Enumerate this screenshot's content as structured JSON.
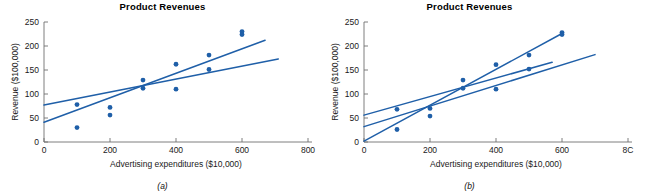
{
  "figure": {
    "panels": [
      {
        "id": "a",
        "caption": "(a)",
        "chart_data": {
          "type": "scatter",
          "title": "Product Revenues",
          "xlabel": "Advertising expenditures ($10,000)",
          "ylabel": "Revenue ($100,000)",
          "xlim": [
            0,
            800
          ],
          "ylim": [
            0,
            250
          ],
          "xticks": [
            0,
            200,
            400,
            600,
            800
          ],
          "yticks": [
            0,
            50,
            100,
            150,
            200,
            250
          ],
          "grid": false,
          "legend": "none",
          "points": [
            {
              "x": 100,
              "y": 78
            },
            {
              "x": 100,
              "y": 30
            },
            {
              "x": 200,
              "y": 72
            },
            {
              "x": 200,
              "y": 56
            },
            {
              "x": 300,
              "y": 129
            },
            {
              "x": 300,
              "y": 112
            },
            {
              "x": 400,
              "y": 162
            },
            {
              "x": 400,
              "y": 110
            },
            {
              "x": 500,
              "y": 181
            },
            {
              "x": 500,
              "y": 151
            },
            {
              "x": 600,
              "y": 230
            },
            {
              "x": 600,
              "y": 224
            }
          ],
          "lines": [
            {
              "name": "steeper-fit",
              "x0": 0,
              "y0": 41,
              "x1": 670,
              "y1": 212
            },
            {
              "name": "flatter-fit",
              "x0": 0,
              "y0": 77,
              "x1": 710,
              "y1": 173
            }
          ]
        }
      },
      {
        "id": "b",
        "caption": "(b)",
        "chart_data": {
          "type": "scatter",
          "title": "Product Revenues",
          "xlabel": "Advertising expenditures ($10,000)",
          "ylabel": "Revenue ($100,000)",
          "xlim": [
            0,
            800
          ],
          "ylim": [
            0,
            250
          ],
          "xticks": [
            0,
            200,
            400,
            600,
            800
          ],
          "yticks": [
            0,
            50,
            100,
            150,
            200,
            250
          ],
          "xtick_last_clipped": "8C",
          "grid": false,
          "legend": "none",
          "points": [
            {
              "x": 100,
              "y": 68
            },
            {
              "x": 100,
              "y": 26
            },
            {
              "x": 200,
              "y": 70
            },
            {
              "x": 200,
              "y": 54
            },
            {
              "x": 300,
              "y": 129
            },
            {
              "x": 300,
              "y": 112
            },
            {
              "x": 400,
              "y": 161
            },
            {
              "x": 400,
              "y": 110
            },
            {
              "x": 500,
              "y": 181
            },
            {
              "x": 500,
              "y": 152
            },
            {
              "x": 600,
              "y": 228
            },
            {
              "x": 600,
              "y": 224
            }
          ],
          "lines": [
            {
              "name": "upper-steep-fit",
              "x0": 0,
              "y0": 2,
              "x1": 600,
              "y1": 226
            },
            {
              "name": "middle-fit",
              "x0": 0,
              "y0": 56,
              "x1": 570,
              "y1": 166
            },
            {
              "name": "lower-fit",
              "x0": 0,
              "y0": 32,
              "x1": 700,
              "y1": 182
            }
          ]
        }
      }
    ]
  },
  "style": {
    "marker_color": "#1F5FA8",
    "line_color": "#1F5FA8",
    "axis_color": "#6f6f6f",
    "text_color": "#1a1a1a",
    "background": "#ffffff"
  }
}
